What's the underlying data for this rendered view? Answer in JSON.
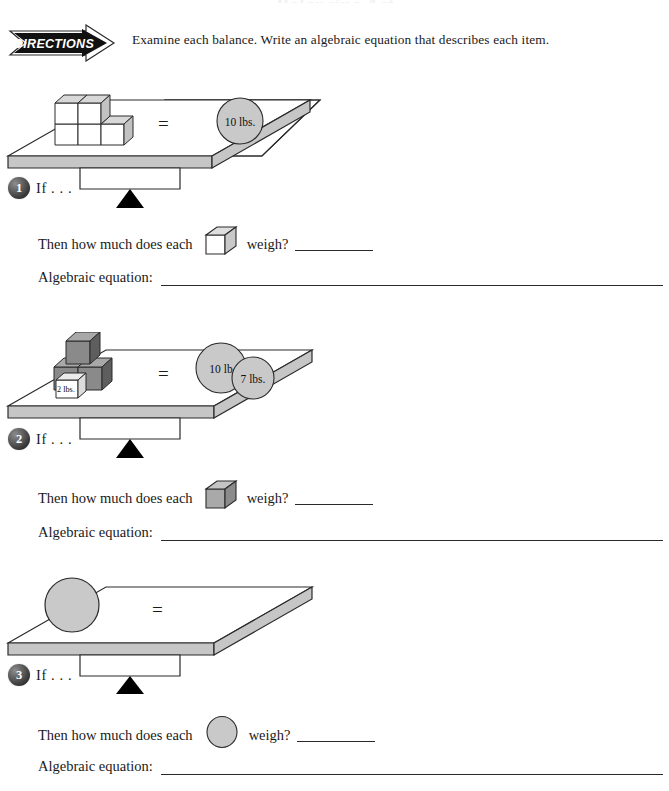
{
  "page": {
    "title": "Balancing Act",
    "directions_banner_label": "DIRECTIONS",
    "directions_text": "Examine each balance. Write an algebraic equation that describes each item."
  },
  "labels": {
    "if_text": "If . . .",
    "then_prefix": "Then how much does each",
    "weigh_suffix": "weigh?",
    "algebraic_equation_label": "Algebraic equation:"
  },
  "colors": {
    "ink": "#1a1a1a",
    "platform_top": "#ffffff",
    "platform_edge": "#b9b9b9",
    "cube_light": "#ffffff",
    "cube_light_shade": "#d0d0d0",
    "cube_dark": "#7c7c7c",
    "cube_dark_shade": "#4f4f4f",
    "weight_circle": "#c4c4c4",
    "badge_dark": "#2e2e2e",
    "fulcrum": "#000000"
  },
  "problems": [
    {
      "number": "1",
      "unknown_shape": "white-cube",
      "left_side": {
        "item_type": "cubes",
        "item_fill": "white",
        "count": 5,
        "arrangement": "3 bottom, 2 top",
        "labeled_items": []
      },
      "operator": "=",
      "right_side": {
        "item_type": "weight-circles",
        "weights": [
          "10 lbs."
        ]
      }
    },
    {
      "number": "2",
      "unknown_shape": "gray-cube",
      "left_side": {
        "item_type": "cubes",
        "item_fill": "gray",
        "count": 3,
        "arrangement": "2 bottom, 1 top",
        "labeled_items": [
          "2 lbs."
        ]
      },
      "operator": "=",
      "right_side": {
        "item_type": "weight-circles",
        "weights": [
          "10 lb",
          "7 lbs."
        ]
      }
    },
    {
      "number": "3",
      "unknown_shape": "gray-circle",
      "left_side": {
        "item_type": "spheres",
        "item_fill": "gray",
        "count": 1,
        "arrangement": "single",
        "labeled_items": []
      },
      "operator": "=",
      "right_side": {
        "item_type": "weight-circles",
        "weights": []
      }
    }
  ]
}
